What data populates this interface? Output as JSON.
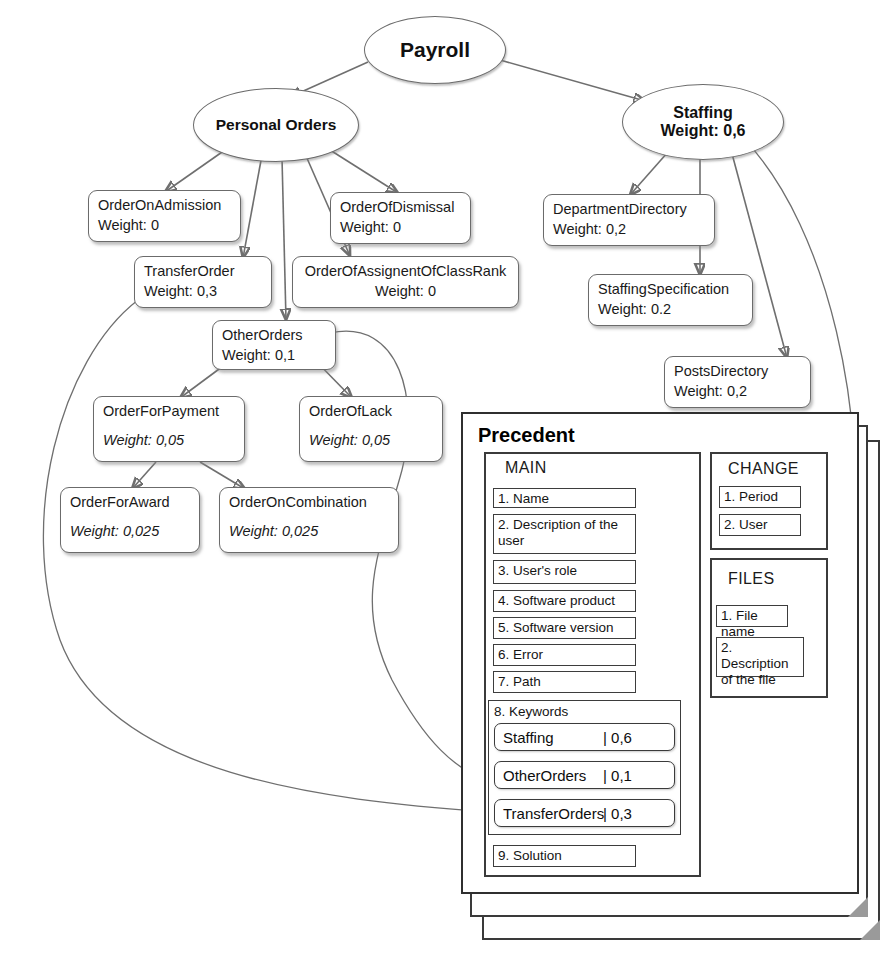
{
  "diagram": {
    "title_node": "Payroll",
    "nodes": [
      {
        "id": "payroll",
        "label": "Payroll",
        "weight": ""
      },
      {
        "id": "personal",
        "label": "Personal Orders",
        "weight": ""
      },
      {
        "id": "staffing",
        "label": "Staffing",
        "weight": "Weight: 0,6"
      },
      {
        "id": "admission",
        "label": "OrderOnAdmission",
        "weight": "Weight: 0"
      },
      {
        "id": "dismissal",
        "label": "OrderOfDismissal",
        "weight": "Weight: 0"
      },
      {
        "id": "transfer",
        "label": "TransferOrder",
        "weight": "Weight: 0,3"
      },
      {
        "id": "classrank",
        "label": "OrderOfAssignentOfClassRank",
        "weight": "Weight: 0"
      },
      {
        "id": "other",
        "label": "OtherOrders",
        "weight": "Weight: 0,1"
      },
      {
        "id": "payment",
        "label": "OrderForPayment",
        "weight": "Weight: 0,05"
      },
      {
        "id": "lack",
        "label": "OrderOfLack",
        "weight": "Weight: 0,05"
      },
      {
        "id": "award",
        "label": "OrderForAward",
        "weight": "Weight: 0,025"
      },
      {
        "id": "combination",
        "label": "OrderOnCombination",
        "weight": "Weight: 0,025"
      },
      {
        "id": "deptdir",
        "label": "DepartmentDirectory",
        "weight": "Weight: 0,2"
      },
      {
        "id": "staffspec",
        "label": "StaffingSpecification",
        "weight": "Weight: 0.2"
      },
      {
        "id": "postsdir",
        "label": "PostsDirectory",
        "weight": "Weight: 0,2"
      }
    ]
  },
  "precedent": {
    "title": "Precedent",
    "main": {
      "title": "MAIN",
      "fields": [
        "1. Name",
        "2. Description of the user",
        "3. User's role",
        "4. Software product",
        "5. Software version",
        "6. Error",
        "7. Path"
      ],
      "keywords_label": "8. Keywords",
      "keywords": [
        {
          "name": "Staffing",
          "value": "| 0,6"
        },
        {
          "name": "OtherOrders",
          "value": "| 0,1"
        },
        {
          "name": "TransferOrders",
          "value": "| 0,3"
        }
      ],
      "solution": "9. Solution"
    },
    "change": {
      "title": "CHANGE",
      "fields": [
        "1. Period",
        "2. User"
      ]
    },
    "files": {
      "title": "FILES",
      "fields": [
        "1. File name",
        "2. Description of the file"
      ]
    }
  },
  "colors": {
    "node_border": "#6b6b6b",
    "card_border": "#2f2f2f",
    "edge": "#6f6f6f",
    "fold": "#9a9a9a",
    "background": "#ffffff"
  }
}
